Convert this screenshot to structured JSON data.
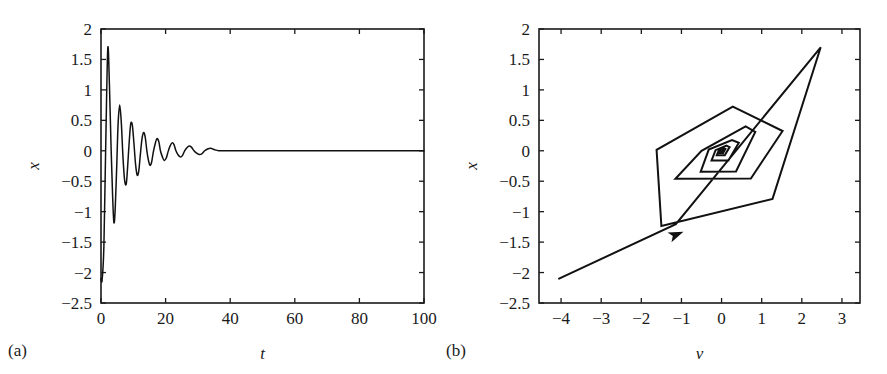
{
  "figure": {
    "panel_a_label": "(a)",
    "panel_b_label": "(b)"
  },
  "chart_data": [
    {
      "id": "panel-a",
      "type": "line",
      "title": "",
      "xlabel": "t",
      "ylabel": "x",
      "xlim": [
        0,
        100
      ],
      "ylim": [
        -2.5,
        2
      ],
      "xticks": [
        0,
        20,
        40,
        60,
        80,
        100
      ],
      "xticklabels": [
        "0",
        "20",
        "40",
        "60",
        "80",
        "100"
      ],
      "yticks": [
        2,
        1.5,
        1,
        0.5,
        0,
        -0.5,
        -1,
        -1.5,
        -2,
        -2.5
      ],
      "yticklabels": [
        "2",
        "1.5",
        "1",
        "0.5",
        "0",
        "−0.5",
        "−1",
        "−1.5",
        "−2",
        "−2.5"
      ],
      "grid": false,
      "legend": false,
      "description": "Damped oscillation of x decaying to zero",
      "series": [
        {
          "name": "x(t)",
          "color": "#111111",
          "x": [
            0.0,
            0.35,
            0.9,
            1.5,
            2.1,
            2.6,
            3.1,
            3.6,
            4.0,
            4.4,
            4.9,
            5.3,
            5.8,
            6.3,
            6.8,
            7.3,
            7.8,
            8.2,
            8.7,
            9.2,
            9.7,
            10.2,
            10.7,
            11.2,
            11.7,
            12.2,
            12.7,
            13.2,
            13.7,
            14.2,
            14.7,
            15.2,
            15.7,
            16.2,
            16.8,
            17.3,
            17.9,
            18.4,
            19.0,
            19.6,
            20.2,
            20.8,
            21.4,
            22.0,
            22.6,
            23.2,
            23.9,
            24.5,
            25.2,
            25.9,
            26.6,
            27.3,
            28.0,
            28.8,
            29.6,
            30.4,
            31.2,
            32.1,
            33.0,
            34.0,
            35.0,
            36.5,
            40.0,
            50.0,
            60.0,
            70.0,
            80.0,
            90.0,
            100.0
          ],
          "y": [
            -2.1,
            -2.12,
            -1.55,
            0.2,
            1.68,
            1.1,
            0.1,
            -0.75,
            -1.18,
            -0.95,
            -0.2,
            0.45,
            0.75,
            0.45,
            -0.1,
            -0.48,
            -0.55,
            -0.3,
            0.12,
            0.44,
            0.42,
            0.12,
            -0.22,
            -0.4,
            -0.33,
            -0.05,
            0.2,
            0.3,
            0.22,
            0.0,
            -0.16,
            -0.24,
            -0.18,
            -0.02,
            0.12,
            0.2,
            0.15,
            0.0,
            -0.1,
            -0.16,
            -0.12,
            -0.01,
            0.08,
            0.13,
            0.1,
            0.0,
            -0.07,
            -0.1,
            -0.08,
            0.0,
            0.05,
            0.08,
            0.06,
            0.0,
            -0.04,
            -0.06,
            -0.05,
            0.0,
            0.03,
            0.04,
            0.02,
            0.0,
            0.0,
            0.0,
            0.0,
            0.0,
            0.0,
            0.0,
            0.0
          ]
        }
      ]
    },
    {
      "id": "panel-b",
      "type": "line",
      "title": "",
      "xlabel": "ν",
      "ylabel": "x",
      "xlim": [
        -4.55,
        3.45
      ],
      "ylim": [
        -2.5,
        2
      ],
      "xticks": [
        -4,
        -3,
        -2,
        -1,
        0,
        1,
        2,
        3
      ],
      "xticklabels": [
        "−4",
        "−3",
        "−2",
        "−1",
        "0",
        "1",
        "2",
        "3"
      ],
      "yticks": [
        2,
        1.5,
        1,
        0.5,
        0,
        -0.5,
        -1,
        -1.5,
        -2,
        -2.5
      ],
      "yticklabels": [
        "2",
        "1.5",
        "1",
        "0.5",
        "0",
        "−0.5",
        "−1",
        "−1.5",
        "−2",
        "−2.5"
      ],
      "grid": false,
      "legend": false,
      "description": "Phase-plane polygonal spiral trajectory converging to the origin, with a direction arrow on the initial segment",
      "annotations": [
        {
          "name": "direction-arrow",
          "x": -0.95,
          "y": -1.33,
          "angle_deg": 22
        }
      ],
      "series": [
        {
          "name": "trajectory",
          "color": "#111111",
          "points": [
            [
              -4.05,
              -2.1
            ],
            [
              -1.14,
              -1.205
            ],
            [
              2.47,
              1.7
            ],
            [
              1.27,
              -0.79
            ],
            [
              -1.5,
              -1.235
            ],
            [
              -1.62,
              0.015
            ],
            [
              0.28,
              0.725
            ],
            [
              1.52,
              0.325
            ],
            [
              0.73,
              -0.455
            ],
            [
              -1.15,
              -0.46
            ],
            [
              -0.5,
              0.0
            ],
            [
              0.6,
              0.4
            ],
            [
              0.84,
              0.31
            ],
            [
              0.36,
              -0.34
            ],
            [
              -0.52,
              -0.345
            ],
            [
              -0.32,
              0.02
            ],
            [
              0.26,
              0.175
            ],
            [
              0.43,
              0.13
            ],
            [
              0.17,
              -0.16
            ],
            [
              -0.25,
              -0.16
            ],
            [
              -0.15,
              0.01
            ],
            [
              0.12,
              0.085
            ],
            [
              0.2,
              0.06
            ],
            [
              0.08,
              -0.075
            ],
            [
              -0.12,
              -0.075
            ],
            [
              -0.07,
              0.005
            ],
            [
              0.06,
              0.04
            ],
            [
              0.095,
              0.03
            ],
            [
              0.04,
              -0.035
            ],
            [
              -0.055,
              -0.035
            ],
            [
              -0.03,
              0.002
            ],
            [
              0.028,
              0.019
            ],
            [
              0.045,
              0.014
            ],
            [
              0.018,
              -0.017
            ],
            [
              -0.026,
              -0.017
            ],
            [
              -0.014,
              0.001
            ],
            [
              0.013,
              0.009
            ],
            [
              0.021,
              0.007
            ],
            [
              0.008,
              -0.008
            ],
            [
              -0.012,
              -0.008
            ],
            [
              -0.006,
              0.0
            ],
            [
              0.006,
              0.004
            ],
            [
              0.01,
              0.003
            ],
            [
              0.004,
              -0.004
            ],
            [
              -0.005,
              -0.004
            ],
            [
              0.0,
              0.0
            ]
          ]
        }
      ]
    }
  ]
}
